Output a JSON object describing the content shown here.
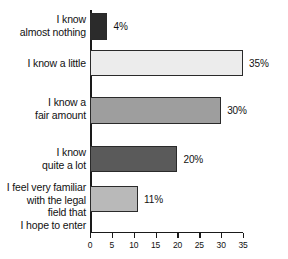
{
  "chart_data": {
    "type": "bar",
    "orientation": "horizontal",
    "title": "",
    "xlabel": "",
    "ylabel": "",
    "xlim": [
      0,
      35
    ],
    "xticks": [
      "0",
      "5",
      "10",
      "15",
      "20",
      "25",
      "30",
      "35"
    ],
    "xtick_values": [
      0,
      5,
      10,
      15,
      20,
      25,
      30,
      35
    ],
    "grid": false,
    "legend": "none",
    "categories": [
      "I know almost nothing",
      "I know a little",
      "I know a fair amount",
      "I know quite a lot",
      "I feel very familiar with the legal field that I hope to enter"
    ],
    "category_lines": [
      [
        "I know",
        "almost nothing"
      ],
      [
        "I know a little"
      ],
      [
        "I know a",
        "fair amount"
      ],
      [
        "I know",
        "quite a lot"
      ],
      [
        "I feel very familiar",
        "with the legal",
        "field that",
        "I hope to enter"
      ]
    ],
    "values": [
      4,
      35,
      30,
      20,
      11
    ],
    "value_labels": [
      "4%",
      "35%",
      "30%",
      "20%",
      "11%"
    ],
    "bar_colors": [
      "#2b2b2b",
      "#ececec",
      "#9e9e9e",
      "#5a5a5a",
      "#b9b9b9"
    ],
    "bar_border_color": "#2a2a2a",
    "axis_color": "#1a1a1a",
    "text_color": "#111111",
    "background_color": "#ffffff"
  }
}
